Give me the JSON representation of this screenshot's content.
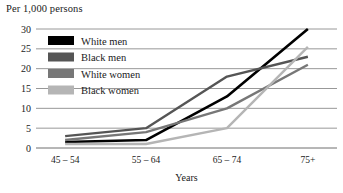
{
  "chart_data": {
    "type": "line",
    "title": "Per 1,000 persons",
    "xlabel": "Years",
    "ylabel": "",
    "categories": [
      "45 – 54",
      "55 – 64",
      "65 – 74",
      "75+"
    ],
    "series": [
      {
        "name": "White men",
        "values": [
          1.5,
          2.0,
          13.0,
          30.0
        ],
        "color": "#000000"
      },
      {
        "name": "Black men",
        "values": [
          3.0,
          5.0,
          18.0,
          23.0
        ],
        "color": "#555555"
      },
      {
        "name": "White women",
        "values": [
          2.0,
          4.0,
          10.0,
          21.0
        ],
        "color": "#777777"
      },
      {
        "name": "Black women",
        "values": [
          1.0,
          1.0,
          5.0,
          25.5
        ],
        "color": "#b5b5b5"
      }
    ],
    "ylim": [
      0,
      30
    ],
    "yticks": [
      0,
      5,
      10,
      15,
      20,
      25,
      30
    ],
    "ytick_labels": [
      "0",
      "5",
      "10",
      "15",
      "20",
      "25",
      "30"
    ],
    "grid": true,
    "legend_position": "upper-left-inside"
  },
  "legend": {
    "entries": [
      {
        "label": "White men"
      },
      {
        "label": "Black men"
      },
      {
        "label": "White women"
      },
      {
        "label": "Black women"
      }
    ]
  }
}
